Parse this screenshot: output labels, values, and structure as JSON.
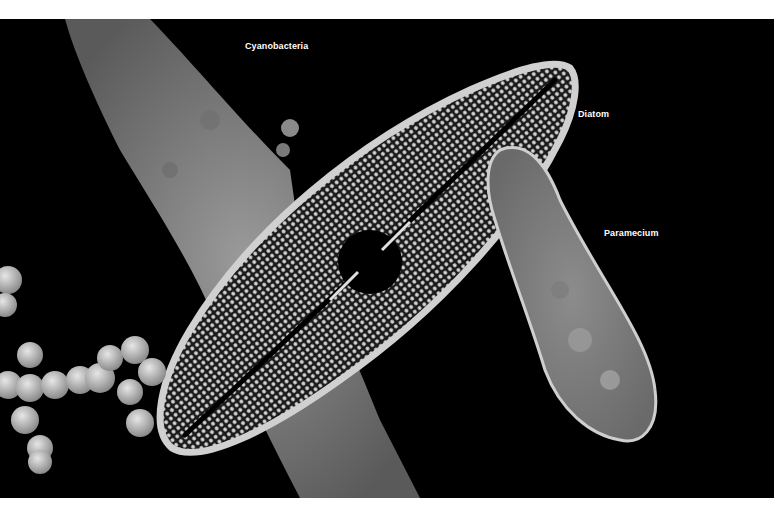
{
  "image": {
    "description": "Grayscale micrograph composite of microorganisms on black background",
    "background_color": "#000000",
    "border_color": "#ffffff"
  },
  "labels": {
    "cyanobacteria": "Cyanobacteria",
    "diatom": "Diatom",
    "paramecium": "Paramecium"
  }
}
